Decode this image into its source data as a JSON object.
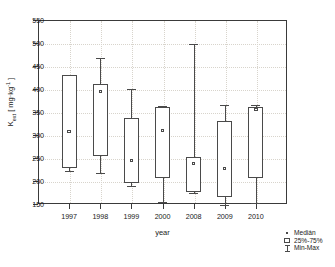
{
  "chart_data": {
    "type": "box",
    "title": "",
    "xlabel": "year",
    "ylabel": "Kₑₓₜ [mg·kg⁻¹]",
    "ylabel_plain": "Kext [mg.kg-1]",
    "categories": [
      "1997",
      "1998",
      "1999",
      "2000",
      "2008",
      "2009",
      "2010"
    ],
    "ylim": [
      150,
      550
    ],
    "ytick_values": [
      150,
      200,
      250,
      300,
      350,
      400,
      450,
      500,
      550
    ],
    "ytick_labels": [
      "150",
      "200",
      "250",
      "300",
      "350",
      "400",
      "450",
      "500",
      "550"
    ],
    "grid": true,
    "legend_position": "right-bottom-outside",
    "boxes": [
      {
        "category": "1997",
        "min": 221,
        "q1": 229,
        "median": 308,
        "q3": 430,
        "max": 431
      },
      {
        "category": "1998",
        "min": 218,
        "q1": 254,
        "median": 394,
        "q3": 410,
        "max": 467
      },
      {
        "category": "1999",
        "min": 190,
        "q1": 196,
        "median": 245,
        "q3": 338,
        "max": 400
      },
      {
        "category": "2000",
        "min": 154,
        "q1": 206,
        "median": 310,
        "q3": 360,
        "max": 362
      },
      {
        "category": "2008",
        "min": 174,
        "q1": 176,
        "median": 238,
        "q3": 252,
        "max": 498
      },
      {
        "category": "2009",
        "min": 147,
        "q1": 166,
        "median": 227,
        "q3": 330,
        "max": 366
      },
      {
        "category": "2010",
        "min": 153,
        "q1": 207,
        "median": 356,
        "q3": 360,
        "max": 365
      }
    ],
    "legend": [
      {
        "key": "median",
        "label": "Medián"
      },
      {
        "key": "iqr",
        "label": "25%-75%"
      },
      {
        "key": "range",
        "label": "Min-Max"
      }
    ]
  }
}
